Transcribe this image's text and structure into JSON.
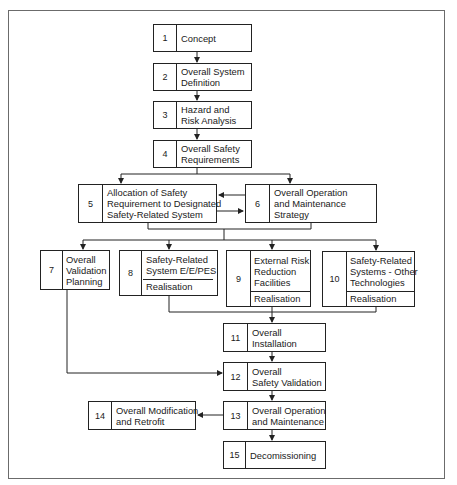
{
  "diagram": {
    "steps": [
      {
        "num": "1",
        "label": "Concept"
      },
      {
        "num": "2",
        "label": "Overall System Definition"
      },
      {
        "num": "3",
        "label": "Hazard and Risk Analysis"
      },
      {
        "num": "4",
        "label": "Overall Safety Requirements"
      },
      {
        "num": "5",
        "label": "Allocation of Safety Requirement to Designated Safety-Related System"
      },
      {
        "num": "6",
        "label": "Overall Operation and Maintenance Strategy"
      },
      {
        "num": "7",
        "label": "Overall Validation Planning"
      },
      {
        "num": "8",
        "label": "Safety-Related System E/E/PES",
        "sub": "Realisation"
      },
      {
        "num": "9",
        "label": "External Risk Reduction Facilities",
        "sub": "Realisation"
      },
      {
        "num": "10",
        "label": "Safety-Related Systems - Other Technologies",
        "sub": "Realisation"
      },
      {
        "num": "11",
        "label": "Overall Installation"
      },
      {
        "num": "12",
        "label": "Overall Safety Validation"
      },
      {
        "num": "13",
        "label": "Overall Operation and Maintenance"
      },
      {
        "num": "14",
        "label": "Overall Modification and Retrofit"
      },
      {
        "num": "15",
        "label": "Decomissioning"
      }
    ],
    "lines": {
      "s1": [
        "Concept"
      ],
      "s2": [
        "Overall System",
        "Definition"
      ],
      "s3": [
        "Hazard and",
        "Risk Analysis"
      ],
      "s4": [
        "Overall Safety",
        "Requirements"
      ],
      "s5": [
        "Allocation of Safety",
        "Requirement to Designated",
        "Safety-Related System"
      ],
      "s6": [
        "Overall Operation",
        "and Maintenance",
        "Strategy"
      ],
      "s7": [
        "Overall",
        "Validation",
        "Planning"
      ],
      "s8": [
        "Safety-Related",
        "System E/E/PES"
      ],
      "s9": [
        "External Risk",
        "Reduction",
        "Facilities"
      ],
      "s10": [
        "Safety-Related",
        "Systems - Other",
        "Technologies"
      ],
      "s11": [
        "Overall",
        "Installation"
      ],
      "s12": [
        "Overall",
        "Safety Validation"
      ],
      "s13": [
        "Overall Operation",
        "and Maintenance"
      ],
      "s14": [
        "Overall Modification",
        "and Retrofit"
      ],
      "s15": [
        "Decomissioning"
      ]
    },
    "colors": {
      "line": "#222222",
      "frame": "#6b6b6b",
      "background": "#ffffff"
    }
  }
}
